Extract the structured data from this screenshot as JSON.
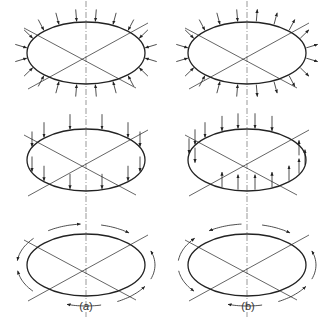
{
  "figure": {
    "columns": [
      {
        "id": "a",
        "label_open": "(",
        "label_letter": "a",
        "label_close": ")",
        "label_italic": true,
        "cx": 86
      },
      {
        "id": "b",
        "label_open": "(",
        "label_letter": "b",
        "label_close": ")",
        "label_italic": false,
        "cx": 247
      }
    ],
    "rows": [
      {
        "id": "radial",
        "cy": 53,
        "description_a": "uniform inward radial loads around ellipse",
        "description_b": "radial loads inward on left half, outward on right half"
      },
      {
        "id": "vertical",
        "cy": 160,
        "description_a": "vertical downward loads around ellipse",
        "description_b": "downward loads on upper-left, upward loads on lower-right"
      },
      {
        "id": "tangential",
        "cy": 265,
        "description_a": "tangential loads circulating one direction",
        "description_b": "tangential loads with reversing direction"
      }
    ],
    "ellipse": {
      "rx": 59,
      "ry": 31
    },
    "stroke_color": "#222222",
    "axis_color": "#555555"
  }
}
